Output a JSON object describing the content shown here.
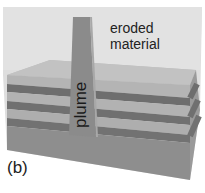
{
  "figure": {
    "panel_label": "(b)",
    "labels": {
      "eroded": "eroded",
      "material": "material",
      "plume": "plume"
    },
    "colors": {
      "background": "#ffffff",
      "enclosure": "#dcdcdc",
      "top_surface": "#b9b9b9",
      "light_layer": "#b0b0b0",
      "dark_layer": "#6f6f6f",
      "substrate": "#8c8c8c",
      "plume": "#8a8a8a",
      "text": "#222222"
    },
    "layers": [
      {
        "name": "top-light-layer",
        "tone": "light"
      },
      {
        "name": "dark-layer-1",
        "tone": "dark"
      },
      {
        "name": "light-layer-2",
        "tone": "light"
      },
      {
        "name": "dark-layer-2",
        "tone": "dark"
      },
      {
        "name": "light-layer-3",
        "tone": "light"
      },
      {
        "name": "dark-layer-3",
        "tone": "dark"
      },
      {
        "name": "substrate",
        "tone": "medium"
      }
    ]
  }
}
